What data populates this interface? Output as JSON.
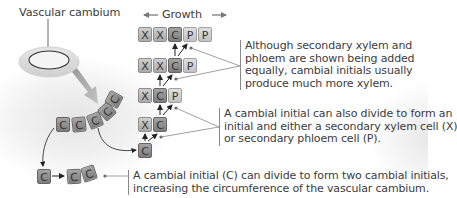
{
  "labels": {
    "vascular_cambium": "Vascular cambium",
    "growth": "Growth"
  },
  "rows": [
    {
      "cells": [
        "X",
        "X",
        "C",
        "P",
        "P"
      ]
    },
    {
      "cells": [
        "X",
        "X",
        "C",
        "P"
      ]
    },
    {
      "cells": [
        "X",
        "C",
        "P"
      ]
    },
    {
      "cells": [
        "X",
        "C"
      ]
    },
    {
      "cells": [
        "C"
      ]
    }
  ],
  "arc_cells": [
    "C",
    "C",
    "C",
    "C",
    "C"
  ],
  "bottom_cells": {
    "left": "C",
    "right": [
      "C",
      "C"
    ]
  },
  "notes": {
    "note1": [
      "Although secondary xylem and",
      "phloem are shown being added",
      "equally, cambial initials usually",
      "produce much more xylem."
    ],
    "note2": [
      "A cambial initial can also divide to form an",
      "initial and either a secondary xylem cell (X)",
      "or secondary phloem cell (P)."
    ],
    "note3": [
      "A cambial initial (C) can divide to form two cambial initials,",
      "increasing the circumference of the vascular cambium."
    ]
  },
  "legend": {
    "X": "secondary xylem cell",
    "P": "secondary phloem cell",
    "C": "cambial initial"
  }
}
